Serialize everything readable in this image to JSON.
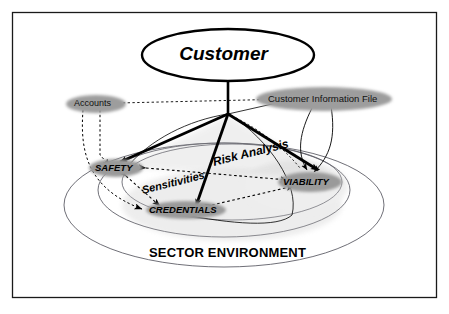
{
  "diagram": {
    "frame": {
      "present": true,
      "color": "#1a1a1a"
    },
    "colors": {
      "background": "#ffffff",
      "line": "#000000",
      "node_fill": "#9a9a9a",
      "ellipse_stroke": "#4a4a4a",
      "shadow": "#bdbdbd"
    },
    "root_node": {
      "label": "Customer",
      "style": "white-ellipse-bold-italic"
    },
    "core_nodes": [
      {
        "id": "safety",
        "label": "SAFETY",
        "style": "gray-ellipse-italic"
      },
      {
        "id": "viability",
        "label": "VIABILITY",
        "style": "gray-ellipse-italic"
      },
      {
        "id": "credentials",
        "label": "CREDENTIALS",
        "style": "gray-ellipse-italic"
      }
    ],
    "source_nodes": [
      {
        "id": "accounts",
        "label": "Accounts",
        "style": "gray-ellipse"
      },
      {
        "id": "cif",
        "label": "Customer Information File",
        "style": "gray-ellipse"
      }
    ],
    "relation_labels": [
      {
        "id": "risk-analysis",
        "label": "Risk Analysis",
        "between": "SAFETY - VIABILITY"
      },
      {
        "id": "sensitivities",
        "label": "Sensitivities",
        "between": "SAFETY - CREDENTIALS"
      }
    ],
    "environment_label": "SECTOR ENVIRONMENT",
    "edges": [
      {
        "from": "Customer",
        "to": "hub",
        "type": "solid-thick"
      },
      {
        "from": "hub",
        "to": "SAFETY",
        "type": "solid-thick-arrow"
      },
      {
        "from": "hub",
        "to": "CREDENTIALS",
        "type": "solid-thick-arrow"
      },
      {
        "from": "hub",
        "to": "VIABILITY",
        "type": "solid-thick-arrow"
      },
      {
        "from": "Accounts",
        "to": "SAFETY",
        "type": "dotted-arrow"
      },
      {
        "from": "Accounts",
        "to": "CREDENTIALS",
        "type": "dotted-arrow"
      },
      {
        "from": "Customer Information File",
        "to": "VIABILITY",
        "type": "thin-curve-arrow"
      },
      {
        "from": "Customer Information File",
        "to": "VIABILITY",
        "type": "thin-curve-arrow"
      },
      {
        "from": "SAFETY",
        "to": "VIABILITY",
        "type": "dotted-bidirectional"
      },
      {
        "from": "SAFETY",
        "to": "CREDENTIALS",
        "type": "dotted-bidirectional"
      },
      {
        "from": "CREDENTIALS",
        "to": "VIABILITY",
        "type": "dotted-bidirectional"
      }
    ]
  }
}
